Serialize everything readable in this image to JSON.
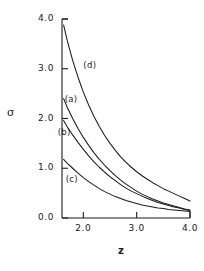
{
  "chart_data": {
    "type": "line",
    "title": "",
    "subtitle": "",
    "xlabel": "z",
    "ylabel": "σ",
    "xlim": [
      1.6,
      4.0
    ],
    "ylim": [
      0.0,
      4.0
    ],
    "xticks": [
      "2.0",
      "3.0",
      "4.0"
    ],
    "xtick_values": [
      2.0,
      3.0,
      4.0
    ],
    "yticks": [
      "4.0",
      "3.0",
      "2.0",
      "1.0",
      "0.0"
    ],
    "ytick_values": [
      4.0,
      3.0,
      2.0,
      1.0,
      0.0
    ],
    "grid": false,
    "legend": "inline-curve-labels",
    "annotations": [
      {
        "text": "(d)",
        "x": 2.15,
        "y": 3.05
      },
      {
        "text": "(a)",
        "x": 1.8,
        "y": 2.38
      },
      {
        "text": "(b)",
        "x": 1.67,
        "y": 1.7
      },
      {
        "text": "(c)",
        "x": 1.82,
        "y": 0.77
      }
    ],
    "series": [
      {
        "name": "(a)",
        "label": "(a)",
        "color": "#1a1a1a",
        "x": [
          1.63,
          1.7,
          1.8,
          1.9,
          2.0,
          2.1,
          2.2,
          2.3,
          2.4,
          2.5,
          2.6,
          2.7,
          2.8,
          2.9,
          3.0,
          3.1,
          3.2,
          3.3,
          3.4,
          3.5,
          3.6,
          3.7,
          3.8,
          3.9,
          4.0
        ],
        "y": [
          2.4,
          2.22,
          2.0,
          1.8,
          1.62,
          1.46,
          1.31,
          1.18,
          1.06,
          0.95,
          0.85,
          0.76,
          0.68,
          0.61,
          0.54,
          0.48,
          0.43,
          0.38,
          0.34,
          0.3,
          0.27,
          0.24,
          0.21,
          0.18,
          0.16
        ]
      },
      {
        "name": "(b)",
        "label": "(b)",
        "color": "#1a1a1a",
        "x": [
          1.63,
          1.7,
          1.8,
          1.9,
          2.0,
          2.1,
          2.2,
          2.3,
          2.4,
          2.5,
          2.6,
          2.7,
          2.8,
          2.9,
          3.0,
          3.1,
          3.2,
          3.3,
          3.4,
          3.5,
          3.6,
          3.7,
          3.8,
          3.9,
          4.0
        ],
        "y": [
          1.96,
          1.83,
          1.67,
          1.52,
          1.38,
          1.25,
          1.13,
          1.02,
          0.92,
          0.83,
          0.75,
          0.67,
          0.6,
          0.54,
          0.49,
          0.44,
          0.39,
          0.35,
          0.31,
          0.28,
          0.25,
          0.22,
          0.2,
          0.17,
          0.15
        ]
      },
      {
        "name": "(c)",
        "label": "(c)",
        "color": "#1a1a1a",
        "x": [
          1.63,
          1.7,
          1.8,
          1.9,
          2.0,
          2.1,
          2.2,
          2.3,
          2.4,
          2.5,
          2.6,
          2.7,
          2.8,
          2.9,
          3.0,
          3.1,
          3.2,
          3.3,
          3.4,
          3.5,
          3.6,
          3.7,
          3.8,
          3.9,
          4.0
        ],
        "y": [
          1.18,
          1.1,
          1.0,
          0.9,
          0.81,
          0.73,
          0.66,
          0.59,
          0.53,
          0.48,
          0.43,
          0.39,
          0.35,
          0.32,
          0.29,
          0.26,
          0.24,
          0.22,
          0.2,
          0.19,
          0.17,
          0.16,
          0.15,
          0.14,
          0.13
        ]
      },
      {
        "name": "(d)",
        "label": "(d)",
        "color": "#1a1a1a",
        "x": [
          1.63,
          1.7,
          1.8,
          1.9,
          2.0,
          2.1,
          2.2,
          2.3,
          2.4,
          2.5,
          2.6,
          2.7,
          2.8,
          2.9,
          3.0,
          3.1,
          3.2,
          3.3,
          3.4,
          3.5,
          3.6,
          3.7,
          3.8,
          3.9,
          4.0
        ],
        "y": [
          3.88,
          3.56,
          3.17,
          2.83,
          2.53,
          2.27,
          2.04,
          1.84,
          1.66,
          1.5,
          1.36,
          1.23,
          1.12,
          1.02,
          0.93,
          0.85,
          0.78,
          0.71,
          0.65,
          0.59,
          0.54,
          0.49,
          0.44,
          0.39,
          0.34
        ]
      }
    ]
  },
  "axes": {
    "y_title": "σ",
    "x_title": "z"
  }
}
